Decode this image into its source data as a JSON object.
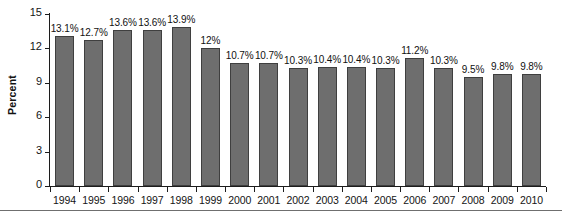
{
  "chart_data": {
    "type": "bar",
    "title": "",
    "subtitle": "",
    "xlabel": "",
    "ylabel": "Percent",
    "ylim": [
      0,
      15
    ],
    "yticks": [
      0,
      3,
      6,
      9,
      12,
      15
    ],
    "ytick_labels": [
      "0",
      "3",
      "6",
      "9",
      "12",
      "15"
    ],
    "grid": false,
    "legend": null,
    "bar_color": "#6e6e6e",
    "bar_edge_color": "#3f3f3f",
    "background_color": "#ffffff",
    "axis_color": "#1c1c1c",
    "categories": [
      "1994",
      "1995",
      "1996",
      "1997",
      "1998",
      "1999",
      "2000",
      "2001",
      "2002",
      "2003",
      "2004",
      "2005",
      "2006",
      "2007",
      "2008",
      "2009",
      "2010"
    ],
    "values": [
      13.1,
      12.7,
      13.6,
      13.6,
      13.9,
      12,
      10.7,
      10.7,
      10.3,
      10.4,
      10.4,
      10.3,
      11.2,
      10.3,
      9.5,
      9.8,
      9.8
    ],
    "data_labels": [
      "13.1%",
      "12.7%",
      "13.6%",
      "13.6%",
      "13.9%",
      "12%",
      "10.7%",
      "10.7%",
      "10.3%",
      "10.4%",
      "10.4%",
      "10.3%",
      "11.2%",
      "10.3%",
      "9.5%",
      "9.8%",
      "9.8%"
    ],
    "series": [
      {
        "name": "Percent",
        "values": [
          13.1,
          12.7,
          13.6,
          13.6,
          13.9,
          12,
          10.7,
          10.7,
          10.3,
          10.4,
          10.4,
          10.3,
          11.2,
          10.3,
          9.5,
          9.8,
          9.8
        ]
      }
    ]
  }
}
